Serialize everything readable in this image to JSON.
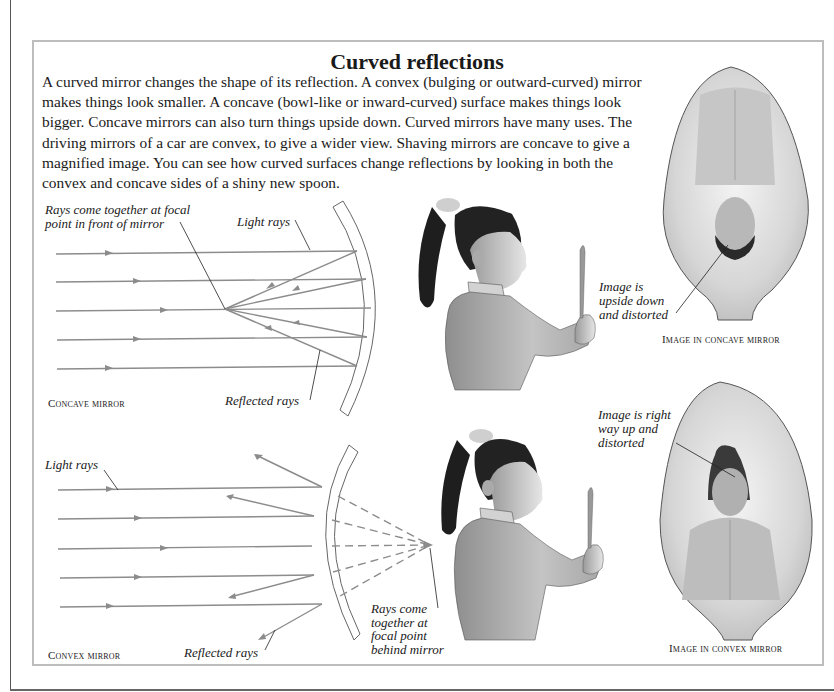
{
  "page": {
    "title": "Curved reflections",
    "intro": "A curved mirror changes the shape of its reflection. A convex (bulging or outward-curved) mirror makes things look smaller. A concave (bowl-like or inward-curved) surface makes things look bigger. Concave mirrors can also turn things upside down. Curved mirrors have many uses. The driving mirrors of a car are convex, to give a wider view. Shaving mirrors are concave to give a magnified image. You can see how curved surfaces change reflections by looking in both the convex and concave sides of a shiny new spoon."
  },
  "concave_diagram": {
    "label_focal": "Rays come together at focal point in front of mirror",
    "label_focal_line1": "Rays come together at focal",
    "label_focal_line2": "point in front of mirror",
    "label_light": "Light rays",
    "label_reflected": "Reflected rays",
    "caption": "Concave mirror"
  },
  "convex_diagram": {
    "label_light": "Light rays",
    "label_reflected": "Reflected rays",
    "label_focal_line1": "Rays come",
    "label_focal_line2": "together at",
    "label_focal_line3": "focal point",
    "label_focal_line4": "behind mirror",
    "caption": "Convex mirror"
  },
  "concave_spoon": {
    "label_line1": "Image is",
    "label_line2": "upside down",
    "label_line3": "and distorted",
    "caption": "Image in concave mirror"
  },
  "convex_spoon": {
    "label_line1": "Image is right",
    "label_line2": "way up and",
    "label_line3": "distorted",
    "caption": "Image in convex mirror"
  },
  "colors": {
    "ray": "#8c8c8c",
    "frame": "#bdbdbd",
    "text": "#1a1a1a"
  }
}
